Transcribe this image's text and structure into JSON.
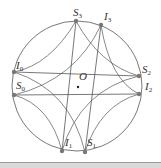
{
  "diagram": {
    "type": "geometric-figure",
    "circle": {
      "cx": 77,
      "cy": 86,
      "r": 65
    },
    "center": {
      "label": "O",
      "x": 78,
      "y": 87
    },
    "points": [
      {
        "id": "S3",
        "base": "S",
        "sub": "3",
        "x": 76,
        "y": 21
      },
      {
        "id": "I3",
        "base": "I",
        "sub": "3",
        "x": 101,
        "y": 25
      },
      {
        "id": "I0",
        "base": "I",
        "sub": "0",
        "x": 14,
        "y": 72
      },
      {
        "id": "S2",
        "base": "S",
        "sub": "2",
        "x": 139,
        "y": 76
      },
      {
        "id": "S0",
        "base": "S",
        "sub": "0",
        "x": 14,
        "y": 95
      },
      {
        "id": "I2",
        "base": "I",
        "sub": "2",
        "x": 139,
        "y": 94
      },
      {
        "id": "I1",
        "base": "I",
        "sub": "1",
        "x": 62,
        "y": 151
      },
      {
        "id": "S1",
        "base": "S",
        "sub": "1",
        "x": 85,
        "y": 152
      }
    ],
    "chords": [
      [
        "I0",
        "S2"
      ],
      [
        "S0",
        "I2"
      ],
      [
        "S3",
        "I1"
      ],
      [
        "I3",
        "S1"
      ]
    ],
    "colors": {
      "stroke": "#555555",
      "point": "#777777",
      "text": "#333333"
    }
  }
}
